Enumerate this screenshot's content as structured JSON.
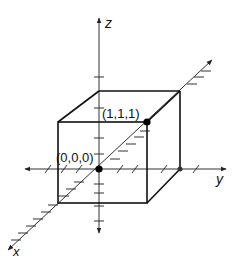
{
  "diagram": {
    "axes": {
      "x_label": "x",
      "y_label": "y",
      "z_label": "z"
    },
    "points": {
      "origin_label": "(0,0,0)",
      "corner_label": "(1,1,1)"
    },
    "colors": {
      "line": "#111111",
      "axis": "#333333",
      "background": "#ffffff"
    }
  }
}
